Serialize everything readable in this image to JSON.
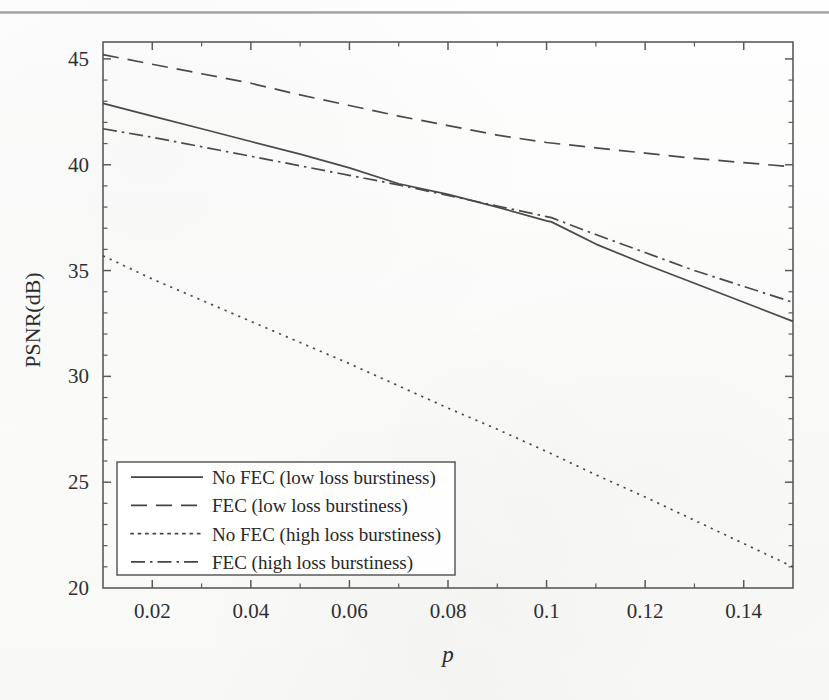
{
  "page": {
    "background_color": "#fdfdfc",
    "rule_color": "#8d8d8d",
    "ink_color": "#4a4a4a"
  },
  "chart_data": {
    "type": "line",
    "title": "",
    "xlabel": "p",
    "ylabel": "PSNR(dB)",
    "xlim": [
      0.01,
      0.15
    ],
    "ylim": [
      20,
      45.8
    ],
    "grid": false,
    "legend_position": "lower-left inside axes",
    "x_ticks": [
      0.02,
      0.04,
      0.06,
      0.08,
      0.1,
      0.12,
      0.14
    ],
    "x_tick_labels": [
      "0.02",
      "0.04",
      "0.06",
      "0.08",
      "0.1",
      "0.12",
      "0.14"
    ],
    "x_minor_ticks": [
      0.01,
      0.03,
      0.05,
      0.07,
      0.09,
      0.11,
      0.13,
      0.15
    ],
    "y_ticks": [
      20,
      25,
      30,
      35,
      40,
      45
    ],
    "y_tick_labels": [
      "20",
      "25",
      "30",
      "35",
      "40",
      "45"
    ],
    "y_minor_ticks": [
      21,
      22,
      23,
      24,
      26,
      27,
      28,
      29,
      31,
      32,
      33,
      34,
      36,
      37,
      38,
      39,
      41,
      42,
      43,
      44
    ],
    "series": [
      {
        "name": "No FEC (low loss burstiness)",
        "dash": "solid",
        "color": "#4a4a4a",
        "x": [
          0.01,
          0.02,
          0.03,
          0.04,
          0.05,
          0.06,
          0.07,
          0.08,
          0.09,
          0.1,
          0.101,
          0.11,
          0.12,
          0.13,
          0.14,
          0.15
        ],
        "y": [
          42.9,
          42.3,
          41.7,
          41.1,
          40.5,
          39.85,
          39.1,
          38.6,
          38.0,
          37.35,
          37.3,
          36.25,
          35.3,
          34.4,
          33.5,
          32.6
        ]
      },
      {
        "name": "FEC (low loss burstiness)",
        "dash": "dashed",
        "color": "#4a4a4a",
        "x": [
          0.01,
          0.02,
          0.03,
          0.04,
          0.05,
          0.06,
          0.07,
          0.08,
          0.09,
          0.1,
          0.11,
          0.12,
          0.13,
          0.14,
          0.15
        ],
        "y": [
          45.2,
          44.75,
          44.3,
          43.85,
          43.3,
          42.8,
          42.3,
          41.85,
          41.4,
          41.05,
          40.8,
          40.55,
          40.3,
          40.1,
          39.9
        ]
      },
      {
        "name": "No FEC (high loss burstiness)",
        "dash": "dotted",
        "color": "#4a4a4a",
        "x": [
          0.01,
          0.02,
          0.03,
          0.04,
          0.05,
          0.06,
          0.07,
          0.08,
          0.09,
          0.1,
          0.11,
          0.12,
          0.13,
          0.14,
          0.15
        ],
        "y": [
          35.7,
          34.6,
          33.6,
          32.6,
          31.6,
          30.6,
          29.55,
          28.5,
          27.5,
          26.45,
          25.35,
          24.3,
          23.2,
          22.1,
          21.0
        ]
      },
      {
        "name": "FEC (high loss burstiness)",
        "dash": "dashdot",
        "color": "#4a4a4a",
        "x": [
          0.01,
          0.02,
          0.03,
          0.04,
          0.05,
          0.06,
          0.07,
          0.08,
          0.09,
          0.1,
          0.101,
          0.11,
          0.12,
          0.13,
          0.14,
          0.15
        ],
        "y": [
          41.7,
          41.3,
          40.85,
          40.4,
          39.95,
          39.5,
          39.05,
          38.55,
          38.05,
          37.55,
          37.5,
          36.7,
          35.85,
          35.0,
          34.25,
          33.5
        ]
      }
    ],
    "legend_entries": [
      "No FEC (low loss burstiness)",
      "FEC (low loss burstiness)",
      "No FEC (high loss burstiness)",
      "FEC (high loss burstiness)"
    ]
  }
}
